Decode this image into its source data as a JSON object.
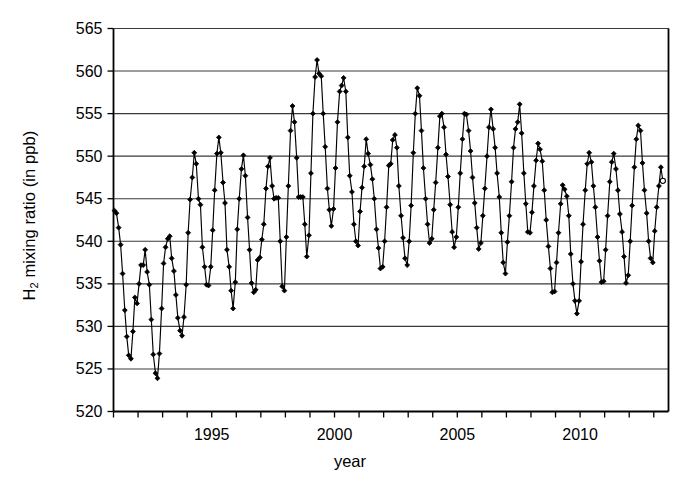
{
  "chart_data": {
    "type": "line",
    "title": "",
    "xlabel": "year",
    "ylabel_html": "H<sub>2</sub> mixing ratio (in ppb)",
    "ylabel_plain": "H2 mixing ratio (in ppb)",
    "ylim": [
      520,
      565
    ],
    "xlim": [
      1991.0,
      2013.6
    ],
    "ytick_values": [
      520,
      525,
      530,
      535,
      540,
      545,
      550,
      555,
      560,
      565
    ],
    "ytick_labels": [
      "520",
      "525",
      "530",
      "535",
      "540",
      "545",
      "550",
      "555",
      "560",
      "565"
    ],
    "xtick_values": [
      1991,
      1992,
      1993,
      1994,
      1995,
      1996,
      1997,
      1998,
      1999,
      2000,
      2001,
      2002,
      2003,
      2004,
      2005,
      2006,
      2007,
      2008,
      2009,
      2010,
      2011,
      2012,
      2013
    ],
    "xtick_labels": [
      "",
      "",
      "",
      "",
      "1995",
      "",
      "",
      "",
      "",
      "2000",
      "",
      "",
      "",
      "",
      "2005",
      "",
      "",
      "",
      "",
      "2010",
      "",
      "",
      ""
    ],
    "xtick_labeled_values": [
      1995,
      2000,
      2005,
      2010
    ],
    "xtick_labeled_text": [
      "1995",
      "2000",
      "2005",
      "2010"
    ],
    "grid": "horizontal",
    "legend": "none",
    "marker": "filled-diamond",
    "marker_last": "open-circle",
    "line_color": "#000000",
    "marker_color": "#000000",
    "series": [
      {
        "name": "H2 mixing ratio",
        "x": [
          1991.04,
          1991.12,
          1991.21,
          1991.29,
          1991.37,
          1991.46,
          1991.54,
          1991.62,
          1991.71,
          1991.79,
          1991.87,
          1991.96,
          1992.04,
          1992.12,
          1992.21,
          1992.29,
          1992.37,
          1992.46,
          1992.54,
          1992.62,
          1992.71,
          1992.79,
          1992.87,
          1992.96,
          1993.04,
          1993.12,
          1993.21,
          1993.29,
          1993.37,
          1993.46,
          1993.54,
          1993.62,
          1993.71,
          1993.79,
          1993.87,
          1993.96,
          1994.04,
          1994.12,
          1994.21,
          1994.29,
          1994.37,
          1994.46,
          1994.54,
          1994.62,
          1994.71,
          1994.79,
          1994.87,
          1994.96,
          1995.04,
          1995.12,
          1995.21,
          1995.29,
          1995.37,
          1995.46,
          1995.54,
          1995.62,
          1995.71,
          1995.79,
          1995.87,
          1995.96,
          1996.04,
          1996.12,
          1996.21,
          1996.29,
          1996.37,
          1996.46,
          1996.54,
          1996.62,
          1996.71,
          1996.79,
          1996.87,
          1996.96,
          1997.04,
          1997.12,
          1997.21,
          1997.29,
          1997.37,
          1997.46,
          1997.54,
          1997.62,
          1997.71,
          1997.79,
          1997.87,
          1997.96,
          1998.04,
          1998.12,
          1998.21,
          1998.29,
          1998.37,
          1998.46,
          1998.54,
          1998.62,
          1998.71,
          1998.79,
          1998.87,
          1998.96,
          1999.04,
          1999.12,
          1999.21,
          1999.29,
          1999.37,
          1999.46,
          1999.54,
          1999.62,
          1999.71,
          1999.79,
          1999.87,
          1999.96,
          2000.04,
          2000.12,
          2000.21,
          2000.29,
          2000.37,
          2000.46,
          2000.54,
          2000.62,
          2000.71,
          2000.79,
          2000.87,
          2000.96,
          2001.04,
          2001.12,
          2001.21,
          2001.29,
          2001.37,
          2001.46,
          2001.54,
          2001.62,
          2001.71,
          2001.79,
          2001.87,
          2001.96,
          2002.04,
          2002.12,
          2002.21,
          2002.29,
          2002.37,
          2002.46,
          2002.54,
          2002.62,
          2002.71,
          2002.79,
          2002.87,
          2002.96,
          2003.04,
          2003.12,
          2003.21,
          2003.29,
          2003.37,
          2003.46,
          2003.54,
          2003.62,
          2003.71,
          2003.79,
          2003.87,
          2003.96,
          2004.04,
          2004.12,
          2004.21,
          2004.29,
          2004.37,
          2004.46,
          2004.54,
          2004.62,
          2004.71,
          2004.79,
          2004.87,
          2004.96,
          2005.04,
          2005.12,
          2005.21,
          2005.29,
          2005.37,
          2005.46,
          2005.54,
          2005.62,
          2005.71,
          2005.79,
          2005.87,
          2005.96,
          2006.04,
          2006.12,
          2006.21,
          2006.29,
          2006.37,
          2006.46,
          2006.54,
          2006.62,
          2006.71,
          2006.79,
          2006.87,
          2006.96,
          2007.04,
          2007.12,
          2007.21,
          2007.29,
          2007.37,
          2007.46,
          2007.54,
          2007.62,
          2007.71,
          2007.79,
          2007.87,
          2007.96,
          2008.04,
          2008.12,
          2008.21,
          2008.29,
          2008.37,
          2008.46,
          2008.54,
          2008.62,
          2008.71,
          2008.79,
          2008.87,
          2008.96,
          2009.04,
          2009.12,
          2009.21,
          2009.29,
          2009.37,
          2009.46,
          2009.54,
          2009.62,
          2009.71,
          2009.79,
          2009.87,
          2009.96,
          2010.04,
          2010.12,
          2010.21,
          2010.29,
          2010.37,
          2010.46,
          2010.54,
          2010.62,
          2010.71,
          2010.79,
          2010.87,
          2010.96,
          2011.04,
          2011.12,
          2011.21,
          2011.29,
          2011.37,
          2011.46,
          2011.54,
          2011.62,
          2011.71,
          2011.79,
          2011.87,
          2011.96,
          2012.04,
          2012.12,
          2012.21,
          2012.29,
          2012.37,
          2012.46,
          2012.54,
          2012.62,
          2012.71,
          2012.79,
          2012.87,
          2012.96,
          2013.04,
          2013.12,
          2013.21,
          2013.29,
          2013.37
        ],
        "y": [
          543.6,
          543.3,
          541.6,
          539.6,
          536.2,
          531.9,
          528.8,
          526.6,
          526.2,
          529.4,
          533.4,
          532.7,
          535.0,
          537.2,
          537.2,
          539.0,
          536.4,
          534.9,
          530.8,
          526.7,
          524.5,
          523.9,
          526.8,
          532.1,
          537.4,
          539.3,
          540.3,
          540.6,
          538.0,
          536.5,
          533.7,
          531.0,
          529.5,
          528.9,
          531.1,
          534.9,
          541.0,
          544.9,
          547.5,
          550.4,
          549.1,
          545.0,
          544.3,
          539.3,
          537.0,
          534.9,
          534.8,
          537.0,
          541.3,
          546.0,
          550.3,
          552.2,
          550.4,
          546.9,
          544.5,
          539.0,
          537.0,
          534.2,
          532.1,
          535.2,
          541.4,
          545.0,
          548.5,
          550.1,
          547.7,
          542.8,
          539.0,
          535.1,
          534.0,
          534.3,
          537.8,
          538.1,
          540.2,
          542.0,
          546.2,
          548.8,
          549.8,
          546.5,
          545.0,
          545.1,
          545.1,
          540.0,
          534.7,
          534.2,
          540.5,
          546.5,
          553.0,
          555.9,
          554.0,
          549.8,
          545.2,
          545.2,
          545.2,
          542.0,
          538.2,
          540.7,
          548.0,
          555.0,
          559.3,
          561.3,
          559.7,
          559.4,
          555.0,
          551.1,
          546.2,
          543.7,
          541.8,
          543.8,
          548.6,
          554.0,
          557.6,
          558.3,
          559.2,
          557.6,
          552.2,
          547.7,
          545.8,
          542.0,
          540.0,
          539.5,
          543.5,
          546.3,
          548.8,
          552.0,
          550.3,
          549.0,
          547.3,
          545.0,
          541.4,
          539.2,
          536.8,
          537.0,
          540.0,
          544.0,
          548.9,
          549.1,
          551.9,
          552.5,
          551.0,
          546.5,
          543.0,
          540.4,
          538.0,
          537.2,
          540.0,
          544.2,
          550.4,
          555.0,
          558.0,
          557.1,
          553.0,
          548.6,
          545.0,
          542.0,
          539.8,
          540.3,
          543.7,
          546.9,
          551.0,
          554.7,
          555.0,
          553.4,
          550.2,
          547.6,
          544.3,
          541.1,
          539.3,
          540.5,
          544.0,
          548.0,
          552.0,
          555.0,
          554.9,
          553.0,
          550.6,
          547.5,
          544.5,
          541.6,
          539.1,
          539.8,
          543.0,
          546.2,
          550.0,
          553.4,
          555.5,
          553.2,
          551.0,
          548.0,
          545.2,
          541.0,
          537.5,
          536.2,
          539.9,
          543.0,
          547.0,
          551.0,
          553.2,
          554.0,
          556.1,
          552.7,
          548.0,
          544.4,
          541.1,
          541.0,
          543.4,
          546.5,
          549.5,
          551.5,
          550.8,
          549.4,
          546.0,
          542.5,
          539.4,
          536.8,
          534.0,
          534.1,
          537.5,
          541.0,
          544.4,
          546.6,
          546.1,
          545.3,
          543.0,
          538.5,
          535.0,
          533.0,
          531.5,
          533.0,
          537.6,
          542.0,
          546.0,
          549.1,
          550.4,
          549.3,
          546.5,
          544.0,
          540.5,
          537.7,
          535.2,
          535.3,
          539.0,
          543.0,
          547.0,
          549.3,
          550.3,
          548.5,
          546.0,
          543.2,
          541.1,
          538.2,
          535.1,
          536.0,
          540.0,
          544.2,
          548.7,
          552.0,
          553.6,
          553.0,
          549.2,
          546.0,
          543.3,
          540.0,
          538.0,
          537.5,
          541.2,
          544.0,
          546.5,
          548.7,
          547.1
        ]
      }
    ]
  },
  "axes": {
    "ylabel_prefix": "H",
    "ylabel_sub": "2",
    "ylabel_suffix": " mixing ratio (in ppb)",
    "xlabel": "year"
  }
}
